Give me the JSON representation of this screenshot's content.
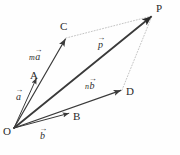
{
  "figure": {
    "width": 180,
    "height": 155,
    "background": "#fefefe",
    "stroke_color": "#3a3a3a",
    "dotted_color": "#b5b5b5"
  },
  "points": [
    {
      "id": "O",
      "label": "O",
      "x": 14,
      "y": 128,
      "label_x": 3,
      "label_y": 126
    },
    {
      "id": "A",
      "label": "A",
      "x": 37,
      "y": 77,
      "label_x": 30,
      "label_y": 70
    },
    {
      "id": "C",
      "label": "C",
      "x": 66,
      "y": 38,
      "label_x": 60,
      "label_y": 21
    },
    {
      "id": "B",
      "label": "B",
      "x": 70,
      "y": 113,
      "label_x": 73,
      "label_y": 111
    },
    {
      "id": "D",
      "label": "D",
      "x": 122,
      "y": 90,
      "label_x": 126,
      "label_y": 86
    },
    {
      "id": "P",
      "label": "P",
      "x": 152,
      "y": 16,
      "label_x": 156,
      "label_y": 3
    }
  ],
  "vectors": [
    {
      "id": "OA",
      "from": "O",
      "to": "A",
      "style": "solid",
      "width": 1.0
    },
    {
      "id": "OC",
      "from": "O",
      "to": "C",
      "style": "solid",
      "width": 1.2
    },
    {
      "id": "OB",
      "from": "O",
      "to": "B",
      "style": "solid",
      "width": 1.0
    },
    {
      "id": "OD",
      "from": "O",
      "to": "D",
      "style": "solid",
      "width": 1.2
    },
    {
      "id": "OP",
      "from": "O",
      "to": "P",
      "style": "solid",
      "width": 1.8
    }
  ],
  "construction_lines": [
    {
      "id": "CP",
      "from": "C",
      "to": "P",
      "style": "dotted"
    },
    {
      "id": "DP",
      "from": "D",
      "to": "P",
      "style": "dotted"
    }
  ],
  "vector_labels": [
    {
      "id": "label-a",
      "scalar": "",
      "letter": "a",
      "arrow": "→",
      "x": 16,
      "y": 92
    },
    {
      "id": "label-ma",
      "scalar": "m",
      "letter": "a",
      "arrow": "→",
      "x": 29,
      "y": 52
    },
    {
      "id": "label-b",
      "scalar": "",
      "letter": "b",
      "arrow": "→",
      "x": 40,
      "y": 131
    },
    {
      "id": "label-nb",
      "scalar": "n",
      "letter": "b",
      "arrow": "→",
      "x": 85,
      "y": 81
    },
    {
      "id": "label-p",
      "scalar": "",
      "letter": "p",
      "arrow": "→",
      "x": 98,
      "y": 40
    }
  ]
}
